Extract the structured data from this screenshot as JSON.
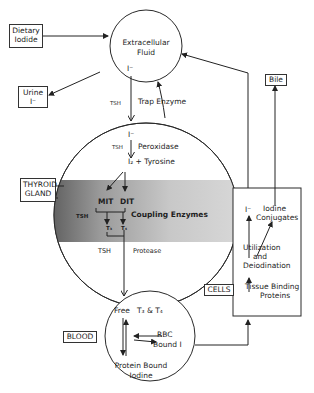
{
  "diagram": {
    "boxes": {
      "dietary_iodide": "Dietary\nIodide",
      "dietary_line1": "Dietary",
      "dietary_line2": "Iodide",
      "urine_line1": "Urine",
      "urine_line2": "I⁻",
      "bile": "Bile",
      "thyroid_line1": "THYROID",
      "thyroid_line2": "GLAND",
      "blood": "BLOOD",
      "cells": "CELLS"
    },
    "extracellular": {
      "line1": "Extracellular",
      "line2": "Fluid",
      "ion": "I⁻"
    },
    "transport": {
      "tsh": "TSH",
      "trap_enzyme": "Trap Enzyme"
    },
    "thyroid": {
      "ion": "I⁻",
      "tsh_top": "TSH",
      "peroxidase": "Peroxidase",
      "i2_tyrosine": "I₂ + Tyrosine",
      "mit": "MIT",
      "dit": "DIT",
      "tsh_coupling": "TSH",
      "coupling_enzymes": "Coupling Enzymes",
      "t3": "T₃",
      "t4": "T₄",
      "tsh_bottom": "TSH",
      "protease": "Protease"
    },
    "blood_circle": {
      "free": "Free",
      "t3_t4": "T₃ & T₄",
      "rbc": "RBC",
      "bound_i": "Bound I",
      "pbi_line1": "Protein Bound",
      "pbi_line2": "Iodine"
    },
    "cells_box": {
      "ion": "I⁻",
      "iodine": "Iodine",
      "conjugates": "Conjugates",
      "utilization": "Utilization",
      "and": "and",
      "deiodination": "Deiodination",
      "tissue_binding": "Tissue Binding",
      "proteins": "Proteins"
    },
    "colors": {
      "line": "#2a2a2a",
      "shade_dark": "#6e6e6e",
      "shade_light": "#d8d8d8"
    }
  }
}
